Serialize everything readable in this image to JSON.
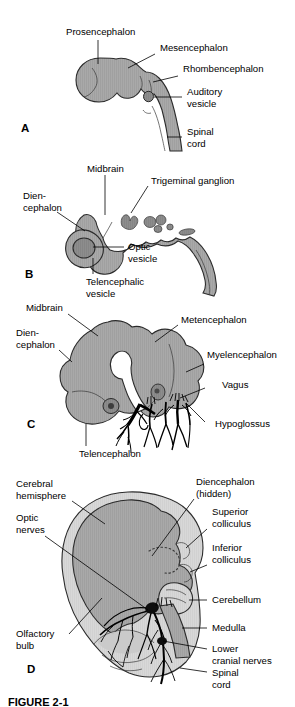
{
  "figure": {
    "title_caption": "FIGURE 2-1",
    "panels": [
      {
        "id": "A",
        "letter": "A",
        "labels": [
          {
            "key": "prosencephalon",
            "text": "Prosencephalon"
          },
          {
            "key": "mesencephalon",
            "text": "Mesencephalon"
          },
          {
            "key": "rhombencephalon",
            "text": "Rhombencephalon"
          },
          {
            "key": "auditory_vesicle_line1",
            "text": "Auditory"
          },
          {
            "key": "auditory_vesicle_line2",
            "text": "vesicle"
          },
          {
            "key": "spinal_cord_line1",
            "text": "Spinal"
          },
          {
            "key": "spinal_cord_line2",
            "text": "cord"
          }
        ]
      },
      {
        "id": "B",
        "letter": "B",
        "labels": [
          {
            "key": "midbrain",
            "text": "Midbrain"
          },
          {
            "key": "trigeminal_ganglion",
            "text": "Trigeminal ganglion"
          },
          {
            "key": "diencephalon_line1",
            "text": "Dien-"
          },
          {
            "key": "diencephalon_line2",
            "text": "cephalon"
          },
          {
            "key": "optic_vesicle_line1",
            "text": "Optic"
          },
          {
            "key": "optic_vesicle_line2",
            "text": "vesicle"
          },
          {
            "key": "telencephalic_vesicle_line1",
            "text": "Telencephalic"
          },
          {
            "key": "telencephalic_vesicle_line2",
            "text": "vesicle"
          }
        ]
      },
      {
        "id": "C",
        "letter": "C",
        "labels": [
          {
            "key": "midbrain",
            "text": "Midbrain"
          },
          {
            "key": "diencephalon_line1",
            "text": "Dien-"
          },
          {
            "key": "diencephalon_line2",
            "text": "cephalon"
          },
          {
            "key": "metencephalon",
            "text": "Metencephalon"
          },
          {
            "key": "myelencephalon",
            "text": "Myelencephalon"
          },
          {
            "key": "vagus",
            "text": "Vagus"
          },
          {
            "key": "hypoglossus",
            "text": "Hypoglossus"
          },
          {
            "key": "telencephalon",
            "text": "Telencephalon"
          }
        ]
      },
      {
        "id": "D",
        "letter": "D",
        "labels": [
          {
            "key": "cerebral_hemisphere_line1",
            "text": "Cerebral"
          },
          {
            "key": "cerebral_hemisphere_line2",
            "text": "hemisphere"
          },
          {
            "key": "optic_nerves_line1",
            "text": "Optic"
          },
          {
            "key": "optic_nerves_line2",
            "text": "nerves"
          },
          {
            "key": "olfactory_bulb_line1",
            "text": "Olfactory"
          },
          {
            "key": "olfactory_bulb_line2",
            "text": "bulb"
          },
          {
            "key": "diencephalon_line1",
            "text": "Diencephalon"
          },
          {
            "key": "diencephalon_line2",
            "text": "(hidden)"
          },
          {
            "key": "superior_colliculus_line1",
            "text": "Superior"
          },
          {
            "key": "superior_colliculus_line2",
            "text": "colliculus"
          },
          {
            "key": "inferior_colliculus_line1",
            "text": "Inferior"
          },
          {
            "key": "inferior_colliculus_line2",
            "text": "colliculus"
          },
          {
            "key": "cerebellum",
            "text": "Cerebellum"
          },
          {
            "key": "medulla",
            "text": "Medulla"
          },
          {
            "key": "lower_cranial_nerves_line1",
            "text": "Lower"
          },
          {
            "key": "lower_cranial_nerves_line2",
            "text": "cranial nerves"
          },
          {
            "key": "spinal_cord_line1",
            "text": "Spinal"
          },
          {
            "key": "spinal_cord_line2",
            "text": "cord"
          }
        ]
      }
    ]
  },
  "colors": {
    "background": "#ffffff",
    "brain_fill": "#a8a8a8",
    "brain_fill_light": "#d6d6d6",
    "vesicle_dark": "#8a8a8a",
    "outline": "#2b2b2b",
    "nerve": "#000000",
    "text": "#000000"
  }
}
